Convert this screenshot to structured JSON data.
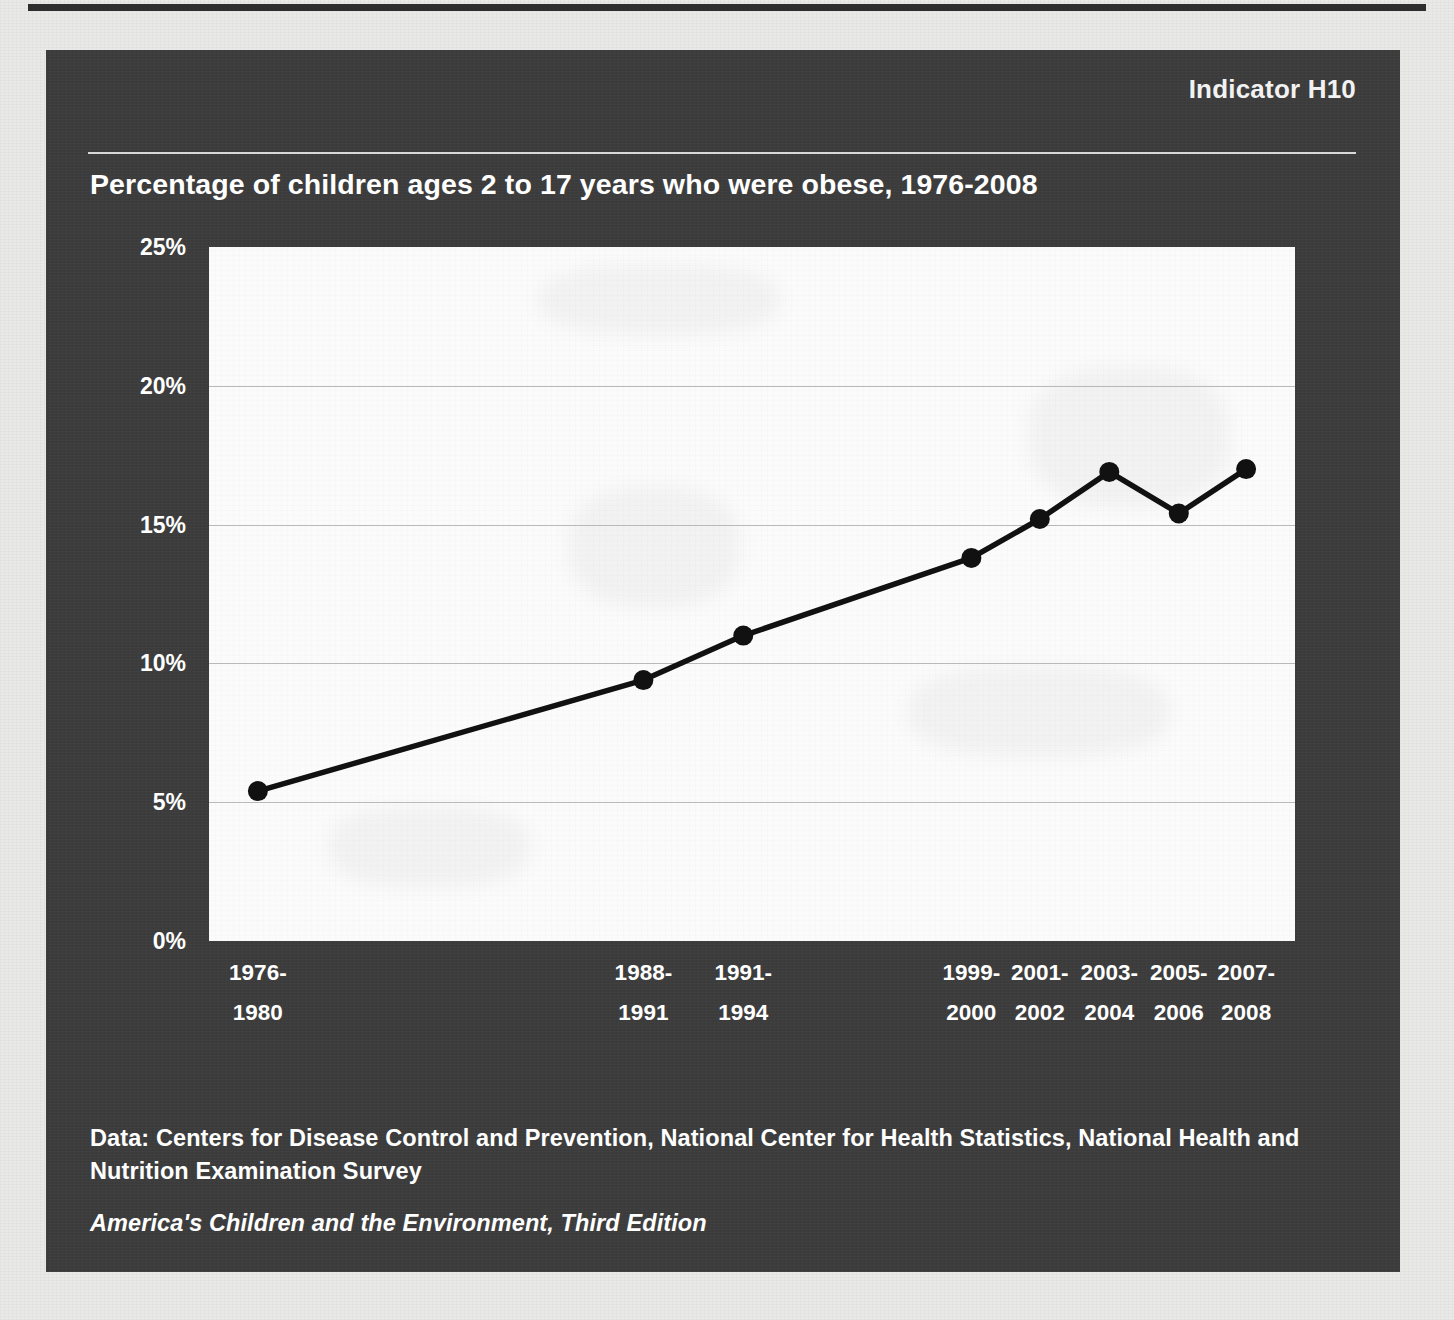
{
  "panel": {
    "indicator": "Indicator H10",
    "title": "Percentage of children ages 2 to 17 years who were obese, 1976-2008"
  },
  "footer": {
    "source_line": "Data: Centers for Disease Control and Prevention, National Center for Health Statistics, National Health and Nutrition Examination Survey",
    "report_line": "America's Children and the Environment, Third Edition"
  },
  "colors": {
    "panel_background": "#3b3b3b",
    "plot_background": "#fbfbfb",
    "series_line": "#111111",
    "marker": "#111111",
    "gridline": "#b9b9b9",
    "text": "#ffffff",
    "page_background": "#e9e9e7"
  },
  "chart_data": {
    "type": "line",
    "title": "Percentage of children ages 2 to 17 years who were obese, 1976-2008",
    "xlabel": "",
    "ylabel": "",
    "ylim": [
      0,
      25
    ],
    "yticks": [
      0,
      5,
      10,
      15,
      20,
      25
    ],
    "ytick_labels": [
      "0%",
      "5%",
      "10%",
      "15%",
      "20%",
      "25%"
    ],
    "grid": true,
    "legend": "none",
    "categories": [
      "1976-1980",
      "1988-1991",
      "1991-1994",
      "1999-2000",
      "2001-2002",
      "2003-2004",
      "2005-2006",
      "2007-2008"
    ],
    "category_lines": [
      [
        "1976-",
        "1980"
      ],
      [
        "1988-",
        "1991"
      ],
      [
        "1991-",
        "1994"
      ],
      [
        "1999-",
        "2000"
      ],
      [
        "2001-",
        "2002"
      ],
      [
        "2003-",
        "2004"
      ],
      [
        "2005-",
        "2006"
      ],
      [
        "2007-",
        "2008"
      ]
    ],
    "x_positions": [
      4.5,
      40.0,
      49.2,
      70.2,
      76.5,
      82.9,
      89.3,
      95.5
    ],
    "values": [
      5.4,
      9.4,
      11.0,
      13.8,
      15.2,
      16.9,
      15.4,
      17.0
    ],
    "series": [
      {
        "name": "Percentage of children ages 2 to 17 who were obese",
        "values": [
          5.4,
          9.4,
          11.0,
          13.8,
          15.2,
          16.9,
          15.4,
          17.0
        ]
      }
    ]
  }
}
